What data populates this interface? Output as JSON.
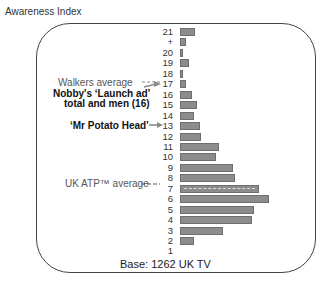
{
  "header": {
    "title": "Awareness Index"
  },
  "annotations": {
    "walkers_average": "Walkers average",
    "nobbys_line1": "Nobby's ‘Launch ad’",
    "nobbys_line2": "total and men (16)",
    "mr_potato_head": "‘Mr Potato Head’",
    "uk_atp_average": "UK ATP™ average"
  },
  "footer": {
    "base_label": "Base: 1262 UK TV"
  },
  "colors": {
    "bar": "#8c8c8c",
    "bar_border": "#6e6e6e",
    "frame": "#444444",
    "arrow": "#8a8a8a"
  },
  "chart_data": {
    "type": "bar",
    "orientation": "horizontal",
    "title": "Awareness Index",
    "xlabel": "",
    "ylabel": "Awareness Index",
    "grid": false,
    "legend": "none",
    "categories": [
      "21",
      "+",
      "20",
      "19",
      "18",
      "17",
      "16",
      "15",
      "14",
      "13",
      "12",
      "11",
      "10",
      "9",
      "8",
      "7",
      "6",
      "5",
      "4",
      "3",
      "2",
      "1"
    ],
    "values": [
      2.2,
      0.9,
      0.4,
      1.3,
      0.4,
      0.9,
      1.8,
      2.5,
      2.1,
      2.9,
      3.1,
      5.7,
      5.3,
      7.8,
      8.1,
      11.6,
      13.1,
      10.9,
      10.6,
      6.3,
      2.1,
      0
    ],
    "annotations": [
      {
        "text": "Walkers average",
        "points_to": "17"
      },
      {
        "text": "Nobby's ‘Launch ad’ total and men (16)",
        "points_to": "17"
      },
      {
        "text": "‘Mr Potato Head’",
        "points_to": "13"
      },
      {
        "text": "UK ATP™ average",
        "points_to": "7"
      }
    ],
    "footnote": "Base: 1262 UK TV"
  }
}
